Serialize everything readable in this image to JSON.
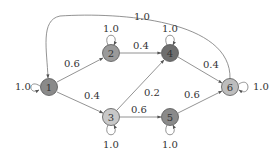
{
  "nodes": [
    {
      "id": "1",
      "x": 49,
      "y": 87,
      "fill": "#8a8a8a"
    },
    {
      "id": "2",
      "x": 111,
      "y": 53,
      "fill": "#9a9a9a"
    },
    {
      "id": "3",
      "x": 111,
      "y": 117,
      "fill": "#c8c8c8"
    },
    {
      "id": "4",
      "x": 170,
      "y": 53,
      "fill": "#6e6e6e"
    },
    {
      "id": "5",
      "x": 170,
      "y": 117,
      "fill": "#8a8a8a"
    },
    {
      "id": "6",
      "x": 230,
      "y": 87,
      "fill": "#bdbdbd"
    }
  ],
  "edges": [
    {
      "from": "1",
      "to": "2",
      "label": "0.6"
    },
    {
      "from": "1",
      "to": "3",
      "label": "0.4"
    },
    {
      "from": "2",
      "to": "4",
      "label": "0.4"
    },
    {
      "from": "3",
      "to": "4",
      "label": "0.2"
    },
    {
      "from": "3",
      "to": "5",
      "label": "0.6"
    },
    {
      "from": "4",
      "to": "6",
      "label": "0.4"
    },
    {
      "from": "5",
      "to": "6",
      "label": "0.6"
    },
    {
      "from": "6",
      "to": "1",
      "label": "1.0"
    }
  ],
  "self_loops": {
    "1": "1.0",
    "2": "1.0",
    "3": "1.0",
    "4": "1.0",
    "5": "1.0",
    "6": "1.0"
  }
}
